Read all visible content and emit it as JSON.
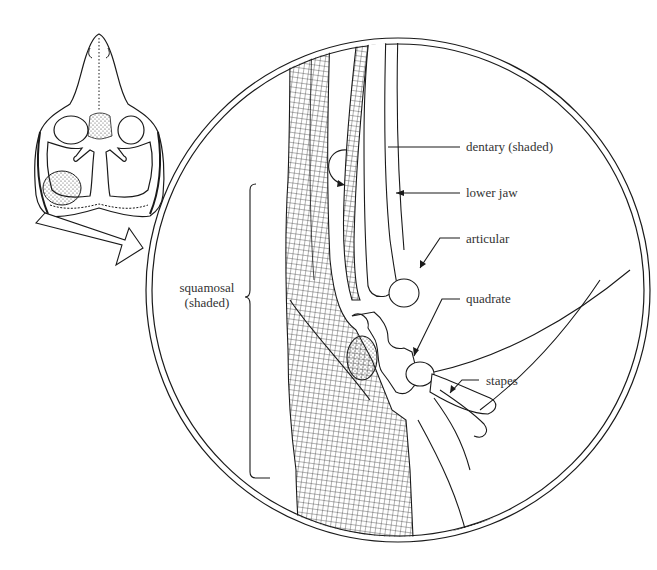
{
  "figure": {
    "type": "anatomical-illustration",
    "labels": {
      "dentary": "dentary (shaded)",
      "lower_jaw": "lower jaw",
      "articular": "articular",
      "quadrate": "quadrate",
      "stapes": "stapes",
      "squamosal_line1": "squamosal",
      "squamosal_line2": "(shaded)"
    },
    "colors": {
      "ink": "#1a1a1a",
      "background": "#ffffff"
    }
  }
}
